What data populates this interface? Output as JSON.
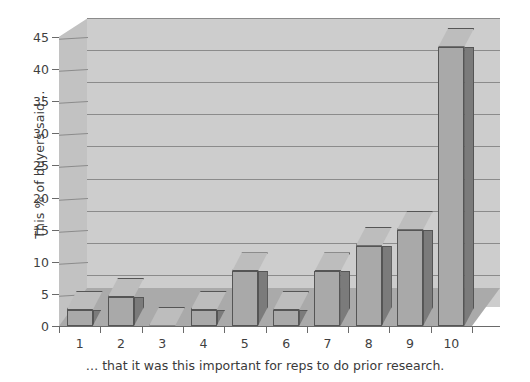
{
  "chart_data": {
    "type": "bar",
    "title": "",
    "subtitle": "",
    "xlabel": "… that it was this important for reps to do prior research.",
    "ylabel": "This % of buyers said…",
    "categories": [
      "1",
      "2",
      "3",
      "4",
      "5",
      "6",
      "7",
      "8",
      "9",
      "10"
    ],
    "values": [
      2.5,
      4.5,
      0,
      2.5,
      8.5,
      2.5,
      8.5,
      12.5,
      15,
      43.5
    ],
    "ylim": [
      0,
      45
    ],
    "yticks": [
      0,
      5,
      10,
      15,
      20,
      25,
      30,
      35,
      40,
      45
    ],
    "ytick_labels": [
      "0",
      "5",
      "10",
      "15",
      "20",
      "25",
      "30",
      "35",
      "40",
      "45"
    ],
    "grid": true,
    "legend": false,
    "legend_position": "none",
    "style": "3d-column",
    "colors": {
      "bar_front": "#a9a9a9",
      "bar_side": "#7b7b7b",
      "bar_top": "#bdbdbd",
      "bar_outline": "#555555",
      "back_wall": "#cdcdcd",
      "left_wall": "#c2c2c2",
      "floor": "#aaaaaa",
      "gridline": "#8b8b8b",
      "axis": "#6a6a6a",
      "text": "#3a3a3a",
      "page_background": "#ffffff"
    }
  }
}
